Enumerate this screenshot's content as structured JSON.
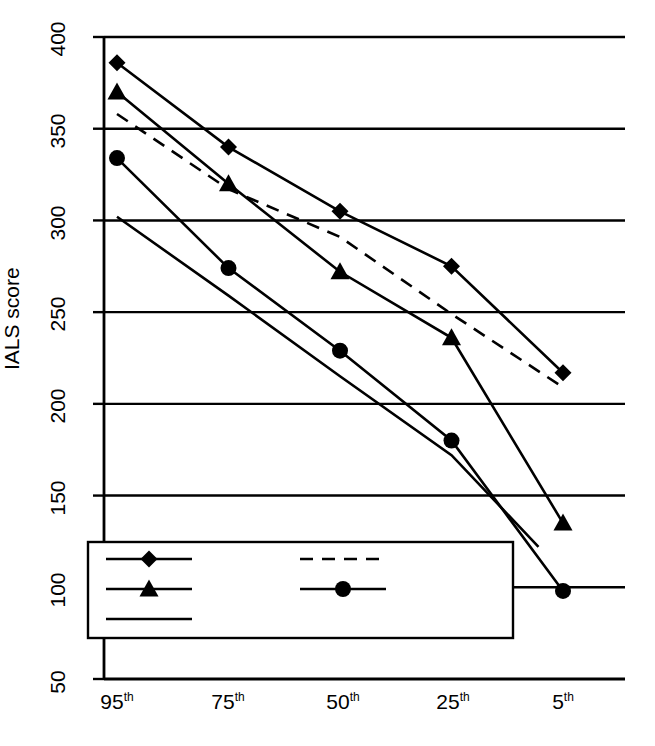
{
  "chart_data": {
    "type": "line",
    "title": "",
    "xlabel": "",
    "ylabel": "IALS score",
    "categories": [
      "95th",
      "75th",
      "50th",
      "25th",
      "5th"
    ],
    "category_bases": [
      "95",
      "75",
      "50",
      "25",
      "5"
    ],
    "category_suffix": "th",
    "ylim": [
      50,
      400
    ],
    "yticks": [
      50,
      100,
      150,
      200,
      250,
      300,
      350,
      400
    ],
    "ytick_labels": [
      "50",
      "100",
      "150",
      "200",
      "250",
      "300",
      "350",
      "400"
    ],
    "grid": "horizontal",
    "legend_position": "lower-left-inside",
    "series": [
      {
        "name": "Sweden",
        "marker": "diamond",
        "line": "solid",
        "color": "#000000",
        "values": [
          386,
          340,
          305,
          275,
          217
        ]
      },
      {
        "name": "USA",
        "marker": "triangle",
        "line": "solid",
        "color": "#000000",
        "values": [
          370,
          320,
          272,
          236,
          135
        ]
      },
      {
        "name": "Germany",
        "marker": "none",
        "line": "dashed",
        "color": "#000000",
        "values": [
          358,
          317,
          291,
          249,
          209
        ]
      },
      {
        "name": "Portugal",
        "marker": "circle",
        "line": "solid",
        "color": "#000000",
        "values": [
          334,
          274,
          229,
          180,
          98
        ]
      },
      {
        "name": "Chile",
        "marker": "none",
        "line": "solid",
        "color": "#000000",
        "values": [
          302,
          259,
          215,
          172,
          108
        ]
      }
    ]
  },
  "legend": {
    "entries": [
      {
        "label": "Sweden",
        "marker": "diamond",
        "line": "solid"
      },
      {
        "label": "Germany",
        "marker": "none",
        "line": "dashed"
      },
      {
        "label": "USA",
        "marker": "triangle",
        "line": "solid"
      },
      {
        "label": "Portugal",
        "marker": "circle",
        "line": "solid"
      },
      {
        "label": "Chile",
        "marker": "none",
        "line": "solid"
      }
    ]
  }
}
